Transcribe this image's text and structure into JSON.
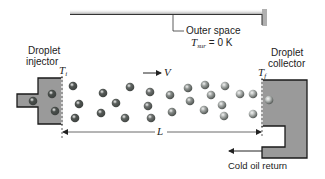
{
  "diagram": {
    "labels": {
      "outer_space": "Outer space",
      "t_sur_symbol": "T",
      "t_sur_subscript": "sur",
      "t_sur_value": "= 0 K",
      "injector_line1": "Droplet",
      "injector_line2": "injector",
      "collector_line1": "Droplet",
      "collector_line2": "collector",
      "t_i_symbol": "T",
      "t_i_subscript": "i",
      "t_f_symbol": "T",
      "t_f_subscript": "f",
      "velocity": "V",
      "length": "L",
      "cold_oil_return": "Cold oil return"
    },
    "colors": {
      "block_fill": "#9a9a9a",
      "block_stroke": "#1a1a1a",
      "hot_droplet": "#4a4f4c",
      "cool_droplet": "#c4c8c6",
      "line": "#222222"
    },
    "droplets": [
      {
        "x": 33,
        "y": 101,
        "shade": 0
      },
      {
        "x": 52,
        "y": 94,
        "shade": 0
      },
      {
        "x": 55,
        "y": 111,
        "shade": 0
      },
      {
        "x": 73,
        "y": 86,
        "shade": 0.05
      },
      {
        "x": 79,
        "y": 104,
        "shade": 0.05
      },
      {
        "x": 75,
        "y": 118,
        "shade": 0.05
      },
      {
        "x": 103,
        "y": 93,
        "shade": 0.1
      },
      {
        "x": 101,
        "y": 113,
        "shade": 0.1
      },
      {
        "x": 116,
        "y": 103,
        "shade": 0.15
      },
      {
        "x": 130,
        "y": 87,
        "shade": 0.2
      },
      {
        "x": 125,
        "y": 118,
        "shade": 0.2
      },
      {
        "x": 150,
        "y": 92,
        "shade": 0.3
      },
      {
        "x": 148,
        "y": 106,
        "shade": 0.3
      },
      {
        "x": 151,
        "y": 118,
        "shade": 0.3
      },
      {
        "x": 170,
        "y": 95,
        "shade": 0.5
      },
      {
        "x": 172,
        "y": 112,
        "shade": 0.5
      },
      {
        "x": 188,
        "y": 88,
        "shade": 0.6
      },
      {
        "x": 190,
        "y": 101,
        "shade": 0.6
      },
      {
        "x": 205,
        "y": 85,
        "shade": 0.7
      },
      {
        "x": 211,
        "y": 95,
        "shade": 0.75
      },
      {
        "x": 204,
        "y": 110,
        "shade": 0.75
      },
      {
        "x": 222,
        "y": 105,
        "shade": 0.8
      },
      {
        "x": 225,
        "y": 86,
        "shade": 0.85
      },
      {
        "x": 224,
        "y": 116,
        "shade": 0.85
      },
      {
        "x": 240,
        "y": 94,
        "shade": 0.9
      },
      {
        "x": 253,
        "y": 94,
        "shade": 0.9
      },
      {
        "x": 253,
        "y": 114,
        "shade": 0.95
      },
      {
        "x": 269,
        "y": 100,
        "shade": 1.0
      }
    ]
  }
}
